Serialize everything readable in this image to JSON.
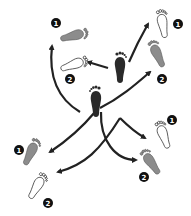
{
  "diagram": {
    "type": "footwork-step-diagram",
    "colors": {
      "start_foot": "#2a2a2a",
      "step1_foot": "#8c8c8c",
      "step2_foot": "#ffffff",
      "arrow": "#222222",
      "badge": "#111111"
    },
    "start_feet": [
      {
        "name": "left-foot-start",
        "x": 95,
        "y": 100,
        "angle": 0
      },
      {
        "name": "right-foot-start",
        "x": 120,
        "y": 68,
        "angle": 0
      }
    ],
    "step_badges": {
      "one": "1",
      "two": "2"
    },
    "targets": [
      {
        "direction": "back-left",
        "step1": {
          "x": 72,
          "y": 33
        },
        "step2": {
          "x": 73,
          "y": 63
        }
      },
      {
        "direction": "forward-right",
        "step1": {
          "x": 162,
          "y": 27,
          "outline": true
        },
        "step2": {
          "x": 155,
          "y": 55,
          "gray": true
        }
      },
      {
        "direction": "left",
        "step1": {
          "x": 27,
          "y": 150
        },
        "step2": {
          "x": 37,
          "y": 188,
          "outline": true
        }
      },
      {
        "direction": "right",
        "step1": {
          "x": 162,
          "y": 135,
          "outline": true
        },
        "step2": {
          "x": 155,
          "y": 162,
          "gray": true
        }
      }
    ]
  }
}
